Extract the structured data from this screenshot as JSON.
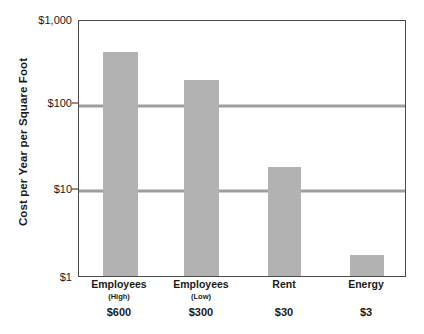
{
  "chart_data": {
    "type": "bar",
    "title": "",
    "subtitle": "",
    "xlabel": "",
    "ylabel": "Cost per Year per Square Foot",
    "yscale": "log",
    "ylim": [
      1,
      1000
    ],
    "grid": "horizontal gridlines at $100 and $10",
    "legend": "none",
    "ytick_labels": [
      "$1,000",
      "$100",
      "$10",
      "$1"
    ],
    "ytick_values": [
      1000,
      100,
      10,
      1
    ],
    "gridline_values": [
      100,
      10
    ],
    "categories": [
      "Employees",
      "Employees",
      "Rent",
      "Energy"
    ],
    "category_sublabels": [
      "(High)",
      "(Low)",
      "",
      ""
    ],
    "value_labels": [
      "$600",
      "$300",
      "$30",
      "$3"
    ],
    "values": [
      600,
      300,
      30,
      3
    ],
    "plotted_values": [
      430,
      205,
      19,
      1.75
    ],
    "bar_color": "#b2b2b2",
    "gridline_color": "#9e9e9e",
    "axis_color": "#4a4a4a",
    "background_color": "#ffffff",
    "bars": [
      {
        "category": "Employees",
        "sublabel": "(High)",
        "value_label": "$600",
        "value": 600,
        "plotted": 430
      },
      {
        "category": "Employees",
        "sublabel": "(Low)",
        "value_label": "$300",
        "value": 300,
        "plotted": 205
      },
      {
        "category": "Rent",
        "sublabel": "",
        "value_label": "$30",
        "value": 30,
        "plotted": 19
      },
      {
        "category": "Energy",
        "sublabel": "",
        "value_label": "$3",
        "value": 3,
        "plotted": 1.75
      }
    ]
  }
}
